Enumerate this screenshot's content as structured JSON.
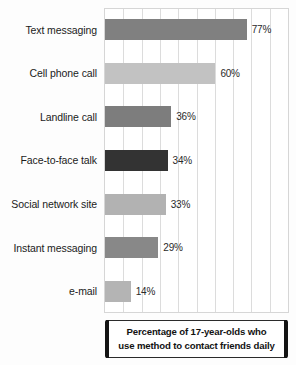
{
  "chart_data": {
    "type": "bar",
    "orientation": "horizontal",
    "title": "",
    "xlabel": "",
    "ylabel": "",
    "xlim": [
      0,
      100
    ],
    "grid": true,
    "gridline_step": 10,
    "legend": "none",
    "value_suffix": "%",
    "categories": [
      "Text messaging",
      "Cell phone call",
      "Landline call",
      "Face-to-face talk",
      "Social network site",
      "Instant messaging",
      "e-mail"
    ],
    "values": [
      77,
      60,
      36,
      34,
      33,
      29,
      14
    ],
    "value_labels": [
      "77%",
      "60%",
      "36%",
      "34%",
      "33%",
      "29%",
      "14%"
    ],
    "bar_colors": [
      "#808080",
      "#c2c2c2",
      "#7d7d7d",
      "#333333",
      "#b2b2b2",
      "#888888",
      "#b4b4b4"
    ]
  },
  "caption": {
    "line1": "Percentage of 17-year-olds who",
    "line2": "use method to contact friends daily"
  },
  "colors": {
    "background": "#ffffff",
    "gridline": "#dcdcdc",
    "axis_border": "#d6d6d6",
    "label_text": "#1b1b1b",
    "caption_bracket": "#141414"
  }
}
